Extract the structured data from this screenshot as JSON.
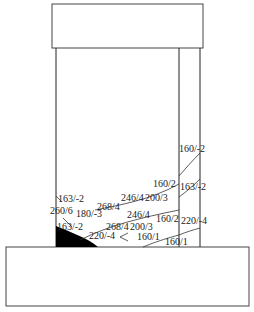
{
  "diagram": {
    "title": "",
    "parts": {
      "top_block": "top block",
      "column": "column",
      "base": "base"
    },
    "labels": [
      {
        "id": "l1",
        "text": "160/-2",
        "x": 179,
        "y": 152
      },
      {
        "id": "l2",
        "text": "160/2",
        "x": 153,
        "y": 187
      },
      {
        "id": "l3",
        "text": "163/-2",
        "x": 180,
        "y": 190
      },
      {
        "id": "l4",
        "text": "246/4",
        "x": 121,
        "y": 201
      },
      {
        "id": "l5",
        "text": "200/3",
        "x": 145,
        "y": 201
      },
      {
        "id": "l6",
        "text": "163/-2",
        "x": 58,
        "y": 202
      },
      {
        "id": "l7",
        "text": "268/4",
        "x": 97,
        "y": 210
      },
      {
        "id": "l8",
        "text": "260/6",
        "x": 50,
        "y": 214
      },
      {
        "id": "l9",
        "text": "180/-3",
        "x": 76,
        "y": 217
      },
      {
        "id": "l10",
        "text": "246/4",
        "x": 127,
        "y": 218
      },
      {
        "id": "l11",
        "text": "160/2",
        "x": 156,
        "y": 222
      },
      {
        "id": "l12",
        "text": "220/-4",
        "x": 181,
        "y": 224
      },
      {
        "id": "l13",
        "text": "163/-2",
        "x": 57,
        "y": 230
      },
      {
        "id": "l14",
        "text": "268/4",
        "x": 106,
        "y": 230
      },
      {
        "id": "l15",
        "text": "200/3",
        "x": 130,
        "y": 230
      },
      {
        "id": "l16",
        "text": "220/-4",
        "x": 89,
        "y": 239
      },
      {
        "id": "l17",
        "text": "160/1",
        "x": 137,
        "y": 240
      },
      {
        "id": "l18",
        "text": "160/1",
        "x": 165,
        "y": 245
      }
    ]
  }
}
